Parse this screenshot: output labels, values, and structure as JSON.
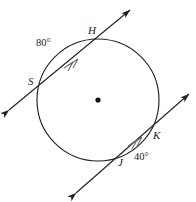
{
  "figure": {
    "type": "circle-geometry-diagram",
    "stroke_color": "#232323",
    "background_color": "#ffffff"
  },
  "circle": {
    "name": "main-circle",
    "center_x": 98,
    "center_y": 100,
    "radius": 61,
    "center_dot_radius": 2.6
  },
  "points": [
    {
      "id": "H",
      "label": "H",
      "x": 102,
      "y": 40
    },
    {
      "id": "S",
      "label": "S",
      "x": 39,
      "y": 86
    },
    {
      "id": "K",
      "label": "K",
      "x": 150,
      "y": 139
    },
    {
      "id": "J",
      "label": "J",
      "x": 124,
      "y": 157
    }
  ],
  "arcs": [
    {
      "id": "arc-SH",
      "label": "80°",
      "value": 80,
      "unit": "degrees",
      "endpoints": [
        "S",
        "H"
      ]
    },
    {
      "id": "arc-JK",
      "label": "40°",
      "value": 40,
      "unit": "degrees",
      "endpoints": [
        "J",
        "K"
      ]
    }
  ],
  "secants": [
    {
      "id": "secant-SH",
      "through": [
        "S",
        "H"
      ],
      "arrow_start": {
        "x": 9,
        "y": 110
      },
      "arrow_end": {
        "x": 130,
        "y": 10
      },
      "tick_marks": 2,
      "tick_style": "double-chevron"
    },
    {
      "id": "secant-JK",
      "through": [
        "J",
        "K"
      ],
      "arrow_start": {
        "x": 76,
        "y": 193
      },
      "arrow_end": {
        "x": 189,
        "y": 94
      },
      "tick_marks": 2,
      "tick_style": "double-chevron"
    }
  ],
  "labels": {
    "H": "H",
    "S": "S",
    "K": "K",
    "J": "J",
    "arc_SH": "80°",
    "arc_JK": "40°"
  }
}
